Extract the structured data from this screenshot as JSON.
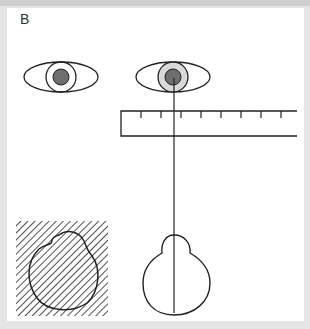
{
  "figure": {
    "panel_label": "B",
    "elements": [
      "left-eye",
      "right-eye-with-sight-line",
      "ruler",
      "hatched-head-outline",
      "head-outline-with-midline"
    ],
    "colors": {
      "background": "#e4e4e4",
      "panel": "#ffffff",
      "stroke": "#222222",
      "pupil": "#6e6e6e",
      "iris_highlight": "#d9d9d9"
    }
  }
}
